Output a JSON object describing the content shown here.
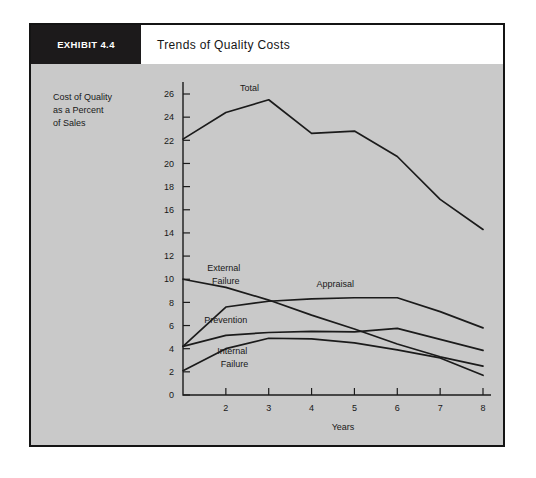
{
  "exhibit": {
    "tag": "EXHIBIT 4.4",
    "title": "Trends of Quality Costs"
  },
  "chart_data": {
    "type": "line",
    "title": "Trends of Quality Costs",
    "xlabel": "Years",
    "ylabel": "Cost of Quality as a Percent of Sales",
    "ylabel_lines": [
      "Cost of Quality",
      "as a Percent",
      "of Sales"
    ],
    "x": [
      1,
      2,
      3,
      4,
      5,
      6,
      7,
      8
    ],
    "xtick_labels": [
      "",
      "2",
      "3",
      "4",
      "5",
      "6",
      "7",
      "8"
    ],
    "ytick_labels": [
      "0",
      "2",
      "4",
      "6",
      "8",
      "10",
      "12",
      "14",
      "16",
      "18",
      "20",
      "22",
      "24",
      "26"
    ],
    "ytick_values": [
      0,
      2,
      4,
      6,
      8,
      10,
      12,
      14,
      16,
      18,
      20,
      22,
      24,
      26
    ],
    "xlim": [
      1,
      8
    ],
    "ylim": [
      0,
      26
    ],
    "grid": false,
    "legend": "inline-labels",
    "line_color": "#1b1b1b",
    "plot_background": "#c9c9c9",
    "series": [
      {
        "name": "Total",
        "label": "Total",
        "values": [
          22.1,
          24.4,
          25.5,
          22.6,
          22.8,
          20.6,
          16.9,
          14.3
        ]
      },
      {
        "name": "External Failure",
        "label": "External Failure",
        "label_lines": [
          "External",
          "Failure"
        ],
        "values": [
          10.0,
          9.3,
          8.2,
          6.9,
          5.7,
          4.4,
          3.3,
          2.5
        ]
      },
      {
        "name": "Appraisal",
        "label": "Appraisal",
        "values": [
          4.2,
          7.6,
          8.1,
          8.3,
          8.4,
          8.4,
          7.2,
          5.8
        ]
      },
      {
        "name": "Prevention",
        "label": "Prevention",
        "values": [
          6.2,
          7.6,
          8.15,
          8.35,
          8.4,
          8.4,
          7.2,
          5.8
        ]
      },
      {
        "name": "Internal Failure",
        "label": "Internal Failure",
        "label_lines": [
          "Internal",
          "Failure"
        ],
        "values": [
          2.1,
          4.0,
          4.9,
          4.85,
          4.5,
          3.9,
          3.2,
          1.7
        ]
      }
    ],
    "series_render": [
      {
        "name": "Total",
        "values": [
          22.1,
          24.4,
          25.5,
          22.6,
          22.8,
          20.6,
          16.9,
          14.3
        ]
      },
      {
        "name": "Appraisal",
        "values": [
          4.2,
          7.6,
          8.1,
          8.3,
          8.4,
          8.4,
          7.2,
          5.8
        ]
      },
      {
        "name": "External Failure",
        "values": [
          10.0,
          9.3,
          8.2,
          6.9,
          5.7,
          4.4,
          3.3,
          2.5
        ]
      },
      {
        "name": "Prevention",
        "values": [
          4.2,
          5.15,
          5.4,
          5.5,
          5.45,
          5.75,
          4.8,
          3.85
        ]
      },
      {
        "name": "Internal Failure",
        "values": [
          2.1,
          4.0,
          4.9,
          4.85,
          4.5,
          3.9,
          3.2,
          1.7
        ]
      }
    ],
    "annotations": [
      {
        "text": "Total",
        "x": 2.55,
        "y": 26.3
      },
      {
        "text": "External",
        "x": 1.95,
        "y": 10.7
      },
      {
        "text": "Failure",
        "x": 2.0,
        "y": 9.55
      },
      {
        "text": "Appraisal",
        "x": 4.55,
        "y": 9.35
      },
      {
        "text": "Prevention",
        "x": 2.0,
        "y": 6.25
      },
      {
        "text": "Internal",
        "x": 2.15,
        "y": 3.55
      },
      {
        "text": "Failure",
        "x": 2.2,
        "y": 2.4
      }
    ]
  }
}
